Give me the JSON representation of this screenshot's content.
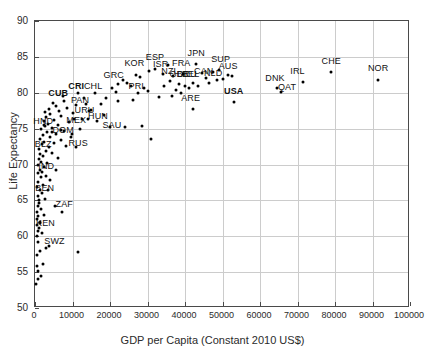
{
  "chart_data": {
    "type": "scatter",
    "title": "",
    "xlabel": "GDP per Capita (Constant 2010 US$)",
    "ylabel": "Life Expectancy",
    "xlim": [
      0,
      100000
    ],
    "ylim": [
      50,
      90
    ],
    "xticks": [
      0,
      10000,
      20000,
      30000,
      40000,
      50000,
      60000,
      70000,
      80000,
      90000,
      100000
    ],
    "yticks": [
      50,
      55,
      60,
      65,
      70,
      75,
      80,
      85,
      90
    ],
    "grid": true,
    "legend": "none",
    "marker": "filled-circle",
    "marker_color": "#000000",
    "labeled_points": [
      {
        "code": "NOR",
        "x": 91500,
        "y": 81.8,
        "bold": false,
        "lx": 91500,
        "ly": 83.4
      },
      {
        "code": "CHE",
        "x": 79000,
        "y": 82.9,
        "bold": false,
        "lx": 79000,
        "ly": 84.4
      },
      {
        "code": "IRL",
        "x": 71500,
        "y": 81.5,
        "bold": false,
        "lx": 70000,
        "ly": 83.0
      },
      {
        "code": "DNK",
        "x": 64500,
        "y": 80.7,
        "bold": false,
        "lx": 64000,
        "ly": 82.1
      },
      {
        "code": "QAT",
        "x": 65500,
        "y": 80.1,
        "bold": false,
        "lx": 67200,
        "ly": 80.8
      },
      {
        "code": "USA",
        "x": 53000,
        "y": 78.7,
        "bold": true,
        "lx": 53000,
        "ly": 80.2
      },
      {
        "code": "SUP",
        "x": 49000,
        "y": 83.2,
        "bold": false,
        "lx": 49500,
        "ly": 84.7
      },
      {
        "code": "AUS",
        "x": 51500,
        "y": 82.5,
        "bold": false,
        "lx": 51500,
        "ly": 83.7
      },
      {
        "code": "NLD",
        "x": 48500,
        "y": 81.8,
        "bold": false,
        "lx": 47500,
        "ly": 82.8
      },
      {
        "code": "CAN",
        "x": 45500,
        "y": 82.0,
        "bold": false,
        "lx": 45000,
        "ly": 83.0
      },
      {
        "code": "JPN",
        "x": 43000,
        "y": 84.0,
        "bold": false,
        "lx": 43000,
        "ly": 85.6
      },
      {
        "code": "BEL",
        "x": 42000,
        "y": 81.4,
        "bold": false,
        "lx": 41500,
        "ly": 82.6
      },
      {
        "code": "DEU",
        "x": 40000,
        "y": 81.0,
        "bold": false,
        "lx": 40500,
        "ly": 82.6
      },
      {
        "code": "GBR",
        "x": 38500,
        "y": 81.2,
        "bold": false,
        "lx": 38500,
        "ly": 82.6
      },
      {
        "code": "FRA",
        "x": 39500,
        "y": 82.6,
        "bold": false,
        "lx": 39000,
        "ly": 84.1
      },
      {
        "code": "NZL",
        "x": 36000,
        "y": 81.7,
        "bold": false,
        "lx": 36000,
        "ly": 83.0
      },
      {
        "code": "ISR",
        "x": 34000,
        "y": 82.6,
        "bold": false,
        "lx": 33500,
        "ly": 84.0
      },
      {
        "code": "ESP",
        "x": 32000,
        "y": 83.3,
        "bold": false,
        "lx": 32000,
        "ly": 85.0
      },
      {
        "code": "KOR",
        "x": 27000,
        "y": 82.5,
        "bold": false,
        "lx": 26500,
        "ly": 84.1
      },
      {
        "code": "GRC",
        "x": 22000,
        "y": 81.2,
        "bold": false,
        "lx": 21000,
        "ly": 82.5
      },
      {
        "code": "PRI",
        "x": 27500,
        "y": 80.0,
        "bold": false,
        "lx": 27000,
        "ly": 80.9
      },
      {
        "code": "ARE",
        "x": 42000,
        "y": 77.7,
        "bold": false,
        "lx": 41500,
        "ly": 79.3
      },
      {
        "code": "CHL",
        "x": 16000,
        "y": 80.0,
        "bold": false,
        "lx": 15500,
        "ly": 81.0
      },
      {
        "code": "CRI",
        "x": 11500,
        "y": 80.0,
        "bold": true,
        "lx": 11000,
        "ly": 81.0
      },
      {
        "code": "CUB",
        "x": 7500,
        "y": 79.5,
        "bold": true,
        "lx": 6200,
        "ly": 79.9
      },
      {
        "code": "PAN",
        "x": 13500,
        "y": 78.5,
        "bold": false,
        "lx": 12000,
        "ly": 79.0
      },
      {
        "code": "URU",
        "x": 14500,
        "y": 77.4,
        "bold": false,
        "lx": 13200,
        "ly": 77.6
      },
      {
        "code": "HUN",
        "x": 14000,
        "y": 76.4,
        "bold": false,
        "lx": 16800,
        "ly": 76.8
      },
      {
        "code": "MEX",
        "x": 10500,
        "y": 76.3,
        "bold": false,
        "lx": 11000,
        "ly": 76.2
      },
      {
        "code": "SAU",
        "x": 20000,
        "y": 75.2,
        "bold": false,
        "lx": 20500,
        "ly": 75.5
      },
      {
        "code": "DOM",
        "x": 7000,
        "y": 74.8,
        "bold": false,
        "lx": 7500,
        "ly": 74.8
      },
      {
        "code": "HND",
        "x": 2400,
        "y": 75.5,
        "bold": false,
        "lx": 2200,
        "ly": 76.1
      },
      {
        "code": "RUS",
        "x": 11000,
        "y": 72.5,
        "bold": false,
        "lx": 11500,
        "ly": 73.0
      },
      {
        "code": "BLZ",
        "x": 4500,
        "y": 74.5,
        "bold": false,
        "lx": 2200,
        "ly": 72.9
      },
      {
        "code": "IND",
        "x": 1900,
        "y": 69.0,
        "bold": false,
        "lx": 3000,
        "ly": 69.8
      },
      {
        "code": "BEN",
        "x": 1100,
        "y": 65.0,
        "bold": false,
        "lx": 2600,
        "ly": 66.7
      },
      {
        "code": "ZAF",
        "x": 7200,
        "y": 63.4,
        "bold": false,
        "lx": 7800,
        "ly": 64.5
      },
      {
        "code": "KEN",
        "x": 1300,
        "y": 61.8,
        "bold": false,
        "lx": 2800,
        "ly": 61.8
      },
      {
        "code": "SWZ",
        "x": 3800,
        "y": 58.7,
        "bold": false,
        "lx": 5200,
        "ly": 59.4
      }
    ],
    "unlabeled_points": [
      {
        "x": 300,
        "y": 53.3
      },
      {
        "x": 900,
        "y": 54.0
      },
      {
        "x": 1500,
        "y": 54.4
      },
      {
        "x": 700,
        "y": 55.1
      },
      {
        "x": 400,
        "y": 55.8
      },
      {
        "x": 2100,
        "y": 56.1
      },
      {
        "x": 600,
        "y": 57.4
      },
      {
        "x": 1200,
        "y": 58.0
      },
      {
        "x": 11500,
        "y": 57.8
      },
      {
        "x": 3000,
        "y": 58.3
      },
      {
        "x": 800,
        "y": 59.2
      },
      {
        "x": 500,
        "y": 60.0
      },
      {
        "x": 1800,
        "y": 60.4
      },
      {
        "x": 700,
        "y": 60.8
      },
      {
        "x": 1000,
        "y": 61.2
      },
      {
        "x": 400,
        "y": 61.6
      },
      {
        "x": 1400,
        "y": 62.0
      },
      {
        "x": 600,
        "y": 62.4
      },
      {
        "x": 900,
        "y": 62.8
      },
      {
        "x": 2300,
        "y": 63.0
      },
      {
        "x": 500,
        "y": 63.4
      },
      {
        "x": 1600,
        "y": 63.8
      },
      {
        "x": 800,
        "y": 64.2
      },
      {
        "x": 5200,
        "y": 64.2
      },
      {
        "x": 1100,
        "y": 64.6
      },
      {
        "x": 2600,
        "y": 65.2
      },
      {
        "x": 700,
        "y": 65.6
      },
      {
        "x": 1900,
        "y": 66.0
      },
      {
        "x": 1300,
        "y": 66.4
      },
      {
        "x": 3400,
        "y": 66.5
      },
      {
        "x": 600,
        "y": 66.8
      },
      {
        "x": 2000,
        "y": 67.2
      },
      {
        "x": 900,
        "y": 67.6
      },
      {
        "x": 4000,
        "y": 67.8
      },
      {
        "x": 1500,
        "y": 68.2
      },
      {
        "x": 2800,
        "y": 68.4
      },
      {
        "x": 700,
        "y": 68.8
      },
      {
        "x": 1200,
        "y": 69.2
      },
      {
        "x": 5500,
        "y": 69.3
      },
      {
        "x": 2400,
        "y": 69.6
      },
      {
        "x": 900,
        "y": 70.0
      },
      {
        "x": 3200,
        "y": 70.2
      },
      {
        "x": 1700,
        "y": 70.4
      },
      {
        "x": 1000,
        "y": 70.8
      },
      {
        "x": 6200,
        "y": 70.9
      },
      {
        "x": 2200,
        "y": 71.2
      },
      {
        "x": 1400,
        "y": 71.5
      },
      {
        "x": 4600,
        "y": 71.6
      },
      {
        "x": 2900,
        "y": 71.9
      },
      {
        "x": 1100,
        "y": 72.2
      },
      {
        "x": 3600,
        "y": 72.4
      },
      {
        "x": 8200,
        "y": 72.6
      },
      {
        "x": 1800,
        "y": 72.8
      },
      {
        "x": 5000,
        "y": 73.0
      },
      {
        "x": 2500,
        "y": 73.2
      },
      {
        "x": 6800,
        "y": 73.4
      },
      {
        "x": 1300,
        "y": 73.6
      },
      {
        "x": 3900,
        "y": 73.8
      },
      {
        "x": 9500,
        "y": 73.9
      },
      {
        "x": 2000,
        "y": 74.1
      },
      {
        "x": 5600,
        "y": 74.3
      },
      {
        "x": 31000,
        "y": 73.6
      },
      {
        "x": 3100,
        "y": 74.5
      },
      {
        "x": 7600,
        "y": 74.7
      },
      {
        "x": 1600,
        "y": 74.9
      },
      {
        "x": 4400,
        "y": 75.1
      },
      {
        "x": 24000,
        "y": 75.2
      },
      {
        "x": 2700,
        "y": 75.3
      },
      {
        "x": 6000,
        "y": 75.5
      },
      {
        "x": 28500,
        "y": 75.4
      },
      {
        "x": 3500,
        "y": 75.7
      },
      {
        "x": 9000,
        "y": 75.9
      },
      {
        "x": 2300,
        "y": 76.0
      },
      {
        "x": 16500,
        "y": 76.1
      },
      {
        "x": 5000,
        "y": 76.2
      },
      {
        "x": 12500,
        "y": 76.4
      },
      {
        "x": 3000,
        "y": 76.6
      },
      {
        "x": 7000,
        "y": 76.8
      },
      {
        "x": 18500,
        "y": 76.9
      },
      {
        "x": 4000,
        "y": 77.0
      },
      {
        "x": 10000,
        "y": 77.2
      },
      {
        "x": 2600,
        "y": 77.3
      },
      {
        "x": 6500,
        "y": 77.5
      },
      {
        "x": 15000,
        "y": 77.6
      },
      {
        "x": 3800,
        "y": 77.8
      },
      {
        "x": 8500,
        "y": 77.9
      },
      {
        "x": 5500,
        "y": 78.1
      },
      {
        "x": 11000,
        "y": 78.3
      },
      {
        "x": 17500,
        "y": 78.4
      },
      {
        "x": 4800,
        "y": 78.6
      },
      {
        "x": 22000,
        "y": 78.8
      },
      {
        "x": 7800,
        "y": 78.9
      },
      {
        "x": 26000,
        "y": 79.0
      },
      {
        "x": 13000,
        "y": 79.2
      },
      {
        "x": 33000,
        "y": 79.4
      },
      {
        "x": 36500,
        "y": 79.6
      },
      {
        "x": 39000,
        "y": 79.9
      },
      {
        "x": 30000,
        "y": 80.3
      },
      {
        "x": 29000,
        "y": 80.6
      },
      {
        "x": 24500,
        "y": 81.3
      },
      {
        "x": 20500,
        "y": 80.7
      },
      {
        "x": 25500,
        "y": 81.0
      },
      {
        "x": 34500,
        "y": 80.9
      },
      {
        "x": 37500,
        "y": 80.4
      },
      {
        "x": 43500,
        "y": 81.0
      },
      {
        "x": 46500,
        "y": 81.4
      },
      {
        "x": 50000,
        "y": 81.9
      },
      {
        "x": 41000,
        "y": 80.6
      },
      {
        "x": 36800,
        "y": 82.3
      },
      {
        "x": 30500,
        "y": 83.0
      },
      {
        "x": 35500,
        "y": 83.8
      },
      {
        "x": 28000,
        "y": 82.2
      },
      {
        "x": 23500,
        "y": 81.8
      },
      {
        "x": 44500,
        "y": 82.8
      },
      {
        "x": 47500,
        "y": 82.9
      },
      {
        "x": 52500,
        "y": 82.3
      },
      {
        "x": 19000,
        "y": 79.2
      },
      {
        "x": 21500,
        "y": 80.1
      },
      {
        "x": 12000,
        "y": 75.0
      },
      {
        "x": 9800,
        "y": 74.2
      }
    ]
  }
}
